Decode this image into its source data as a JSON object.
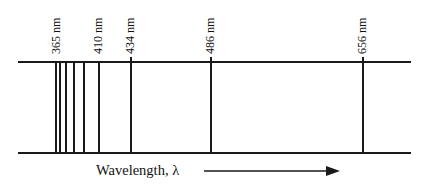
{
  "spectrum": {
    "top_y": 61,
    "bottom_y": 152,
    "left_x": 18,
    "right_x": 411,
    "lines": [
      {
        "x": 55,
        "label": "365 nm"
      },
      {
        "x": 59,
        "label": ""
      },
      {
        "x": 65,
        "label": ""
      },
      {
        "x": 73,
        "label": ""
      },
      {
        "x": 83,
        "label": ""
      },
      {
        "x": 98,
        "label": "410 nm"
      },
      {
        "x": 130,
        "label": "434 nm"
      },
      {
        "x": 210,
        "label": "486 nm"
      },
      {
        "x": 362,
        "label": "656 nm"
      }
    ]
  },
  "axis": {
    "label": "Wavelength, λ",
    "arrow_start_x": 204,
    "arrow_end_x": 339,
    "arrow_y": 171
  },
  "labels": {
    "l365": "365 nm",
    "l410": "410 nm",
    "l434": "434 nm",
    "l486": "486 nm",
    "l656": "656 nm"
  }
}
